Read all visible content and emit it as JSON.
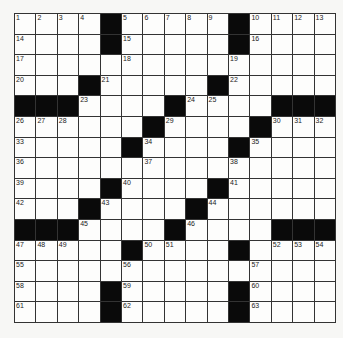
{
  "puzzle": {
    "rows": 15,
    "cols": 15,
    "colors": {
      "black": "#0a0a0a",
      "white": "#fdfdfc",
      "line": "#333333"
    },
    "layout": [
      "....#.....#....",
      "....#.....#....",
      "...............",
      "...#.....#.....",
      "###....#....###",
      "......#....#...",
      ".....#....#....",
      "...............",
      "....#....#.....",
      "...#....#......",
      "###....#....###",
      ".....#....#....",
      "...............",
      "....#.....#....",
      "....#.....#...."
    ],
    "numbers": [
      {
        "r": 0,
        "c": 0,
        "n": "1"
      },
      {
        "r": 0,
        "c": 1,
        "n": "2"
      },
      {
        "r": 0,
        "c": 2,
        "n": "3"
      },
      {
        "r": 0,
        "c": 3,
        "n": "4"
      },
      {
        "r": 0,
        "c": 5,
        "n": "5"
      },
      {
        "r": 0,
        "c": 6,
        "n": "6"
      },
      {
        "r": 0,
        "c": 7,
        "n": "7"
      },
      {
        "r": 0,
        "c": 8,
        "n": "8"
      },
      {
        "r": 0,
        "c": 9,
        "n": "9"
      },
      {
        "r": 0,
        "c": 11,
        "n": "10"
      },
      {
        "r": 0,
        "c": 12,
        "n": "11"
      },
      {
        "r": 0,
        "c": 13,
        "n": "12"
      },
      {
        "r": 0,
        "c": 14,
        "n": "13"
      },
      {
        "r": 1,
        "c": 0,
        "n": "14"
      },
      {
        "r": 1,
        "c": 5,
        "n": "15"
      },
      {
        "r": 1,
        "c": 11,
        "n": "16"
      },
      {
        "r": 2,
        "c": 0,
        "n": "17"
      },
      {
        "r": 2,
        "c": 5,
        "n": "18"
      },
      {
        "r": 2,
        "c": 10,
        "n": "19"
      },
      {
        "r": 3,
        "c": 0,
        "n": "20"
      },
      {
        "r": 3,
        "c": 4,
        "n": "21"
      },
      {
        "r": 3,
        "c": 10,
        "n": "22"
      },
      {
        "r": 4,
        "c": 3,
        "n": "23"
      },
      {
        "r": 4,
        "c": 8,
        "n": "24"
      },
      {
        "r": 4,
        "c": 9,
        "n": "25"
      },
      {
        "r": 5,
        "c": 0,
        "n": "26"
      },
      {
        "r": 5,
        "c": 1,
        "n": "27"
      },
      {
        "r": 5,
        "c": 2,
        "n": "28"
      },
      {
        "r": 5,
        "c": 7,
        "n": "29"
      },
      {
        "r": 5,
        "c": 12,
        "n": "30"
      },
      {
        "r": 5,
        "c": 13,
        "n": "31"
      },
      {
        "r": 5,
        "c": 14,
        "n": "32"
      },
      {
        "r": 6,
        "c": 0,
        "n": "33"
      },
      {
        "r": 6,
        "c": 6,
        "n": "34"
      },
      {
        "r": 6,
        "c": 11,
        "n": "35"
      },
      {
        "r": 7,
        "c": 0,
        "n": "36"
      },
      {
        "r": 7,
        "c": 6,
        "n": "37"
      },
      {
        "r": 7,
        "c": 10,
        "n": "38"
      },
      {
        "r": 8,
        "c": 0,
        "n": "39"
      },
      {
        "r": 8,
        "c": 5,
        "n": "40"
      },
      {
        "r": 8,
        "c": 10,
        "n": "41"
      },
      {
        "r": 9,
        "c": 0,
        "n": "42"
      },
      {
        "r": 9,
        "c": 4,
        "n": "43"
      },
      {
        "r": 9,
        "c": 9,
        "n": "44"
      },
      {
        "r": 10,
        "c": 3,
        "n": "45"
      },
      {
        "r": 10,
        "c": 8,
        "n": "46"
      },
      {
        "r": 11,
        "c": 0,
        "n": "47"
      },
      {
        "r": 11,
        "c": 1,
        "n": "48"
      },
      {
        "r": 11,
        "c": 2,
        "n": "49"
      },
      {
        "r": 11,
        "c": 6,
        "n": "50"
      },
      {
        "r": 11,
        "c": 7,
        "n": "51"
      },
      {
        "r": 11,
        "c": 12,
        "n": "52"
      },
      {
        "r": 11,
        "c": 13,
        "n": "53"
      },
      {
        "r": 11,
        "c": 14,
        "n": "54"
      },
      {
        "r": 12,
        "c": 0,
        "n": "55"
      },
      {
        "r": 12,
        "c": 5,
        "n": "56"
      },
      {
        "r": 12,
        "c": 11,
        "n": "57"
      },
      {
        "r": 13,
        "c": 0,
        "n": "58"
      },
      {
        "r": 13,
        "c": 5,
        "n": "59"
      },
      {
        "r": 13,
        "c": 11,
        "n": "60"
      },
      {
        "r": 14,
        "c": 0,
        "n": "61"
      },
      {
        "r": 14,
        "c": 5,
        "n": "62"
      },
      {
        "r": 14,
        "c": 11,
        "n": "63"
      }
    ]
  }
}
